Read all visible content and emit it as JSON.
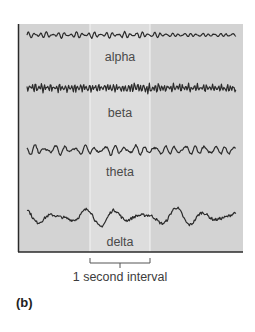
{
  "figure": {
    "panel_letter": "(b)",
    "interval_label": "1 second interval",
    "colors": {
      "panel_bg": "#d3d3d3",
      "highlight_bg": "#dedede",
      "highlight_line": "#f4f4f4",
      "wave": "#2b2b2b",
      "border": "#2a2a2a",
      "bracket": "#555555"
    },
    "waves": [
      {
        "name": "alpha",
        "label": "alpha",
        "amplitude": 0.35,
        "frequency_hz": 10,
        "roughness": 0.25
      },
      {
        "name": "beta",
        "label": "beta",
        "amplitude": 0.45,
        "frequency_hz": 20,
        "roughness": 0.55
      },
      {
        "name": "theta",
        "label": "theta",
        "amplitude": 0.55,
        "frequency_hz": 6,
        "roughness": 0.35
      },
      {
        "name": "delta",
        "label": "delta",
        "amplitude": 1.0,
        "frequency_hz": 2,
        "roughness": 0.3
      }
    ]
  }
}
